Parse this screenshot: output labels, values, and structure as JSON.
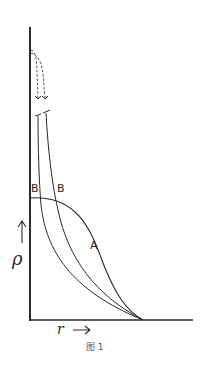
{
  "figure": {
    "caption": "图 1",
    "y_axis_label": "ρ",
    "x_axis_label": "r",
    "x_arrow": "→",
    "y_arrow": "↑",
    "curve_labels": {
      "A": "A",
      "B_left": "B",
      "B_right": "B"
    },
    "colors": {
      "line": "#2a2a2a",
      "background": "#ffffff"
    }
  }
}
